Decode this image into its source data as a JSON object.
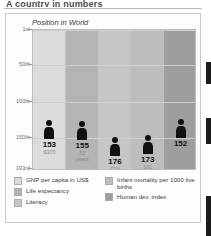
{
  "document": {
    "title": "A country in numbers"
  },
  "chart_data": {
    "type": "bar",
    "title": "Position in World",
    "xlabel": "",
    "ylabel": "Position in World",
    "ylim": [
      1,
      193
    ],
    "grid": true,
    "legend_position": "bottom",
    "ytick_labels": [
      "1st",
      "50th",
      "100th",
      "150th",
      "193rd"
    ],
    "ytick_values": [
      1,
      50,
      100,
      150,
      193
    ],
    "categories": [
      "GNP per capita in US$",
      "Life expectancy",
      "Literacy",
      "Infant mortality per 1000 live births",
      "Human dev. index"
    ],
    "values": [
      153,
      155,
      176,
      173,
      152
    ],
    "point_labels": [
      "153",
      "155",
      "176",
      "173",
      "152"
    ],
    "point_sublabels": [
      "$370",
      "52 years",
      "42%",
      "101 deaths",
      ""
    ],
    "band_colors": [
      "#dcdcdc",
      "#b4b4b4",
      "#c6c6c6",
      "#bdbdbd",
      "#9e9e9e"
    ]
  },
  "chart": {
    "caption": "Position in World",
    "yticks": [
      {
        "label": "1st",
        "value": 1
      },
      {
        "label": "50th",
        "value": 50
      },
      {
        "label": "100th",
        "value": 100
      },
      {
        "label": "150th",
        "value": 150
      },
      {
        "label": "193rd",
        "value": 193
      }
    ],
    "figures": [
      {
        "rank": "153",
        "sub": "$370",
        "sub2": "",
        "value": 153,
        "band": "#dcdcdc"
      },
      {
        "rank": "155",
        "sub": "52",
        "sub2": "years",
        "value": 155,
        "band": "#b4b4b4"
      },
      {
        "rank": "176",
        "sub": "42%",
        "sub2": "",
        "value": 176,
        "band": "#c6c6c6"
      },
      {
        "rank": "173",
        "sub": "101",
        "sub2": "deaths",
        "value": 173,
        "band": "#bdbdbd"
      },
      {
        "rank": "152",
        "sub": "",
        "sub2": "",
        "value": 152,
        "band": "#9e9e9e"
      }
    ]
  },
  "legend": {
    "left": [
      {
        "label": "GNP per capita in US$",
        "color": "#dcdcdc"
      },
      {
        "label": "Life expectancy",
        "color": "#b4b4b4"
      },
      {
        "label": "Literacy",
        "color": "#c6c6c6"
      }
    ],
    "right": [
      {
        "label": "Infant mortality per 1000 live births",
        "color": "#bdbdbd"
      },
      {
        "label": "Human dev. index",
        "color": "#9e9e9e"
      }
    ]
  }
}
